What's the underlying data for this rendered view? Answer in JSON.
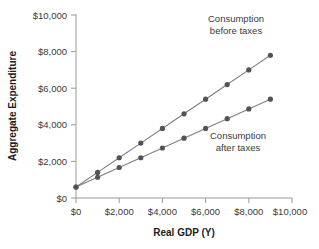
{
  "chart_data": {
    "type": "line",
    "title": "",
    "xlabel": "Real GDP (Y)",
    "ylabel": "Aggregate Expenditure",
    "xlim": [
      0,
      10000
    ],
    "ylim": [
      0,
      10000
    ],
    "grid": false,
    "legend_position": "inline-annotation",
    "x_ticks": [
      0,
      2000,
      4000,
      6000,
      8000,
      10000
    ],
    "x_tick_labels": [
      "$0",
      "$2,000",
      "$4,000",
      "$6,000",
      "$8,000",
      "$10,000"
    ],
    "y_ticks": [
      0,
      2000,
      4000,
      6000,
      8000,
      10000
    ],
    "y_tick_labels": [
      "$0",
      "$2,000",
      "$4,000",
      "$6,000",
      "$8,000",
      "$10,000"
    ],
    "x": [
      0,
      1000,
      2000,
      3000,
      4000,
      5000,
      6000,
      7000,
      8000,
      9000
    ],
    "series": [
      {
        "name": "Consumption before taxes",
        "color": "#52535a",
        "values": [
          600,
          1400,
          2200,
          3000,
          3800,
          4600,
          5400,
          6200,
          7000,
          7800
        ]
      },
      {
        "name": "Consumption after taxes",
        "color": "#52535a",
        "values": [
          600,
          1133,
          1667,
          2200,
          2733,
          3267,
          3800,
          4333,
          4867,
          5400
        ]
      }
    ],
    "annotations": [
      {
        "name": "before-taxes-label",
        "lines": [
          "Consumption",
          "before taxes"
        ],
        "x": 7400,
        "y": 9400
      },
      {
        "name": "after-taxes-label",
        "lines": [
          "Consumption",
          "after taxes"
        ],
        "x": 7500,
        "y": 3350
      }
    ]
  }
}
